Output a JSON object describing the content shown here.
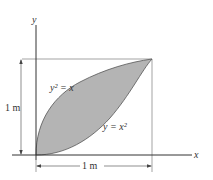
{
  "diagram": {
    "type": "area-between-curves",
    "axes": {
      "x_label": "x",
      "y_label": "y"
    },
    "curves": [
      {
        "label": "y² = x",
        "equation": "y^2 = x"
      },
      {
        "label": "y = x²",
        "equation": "y = x^2"
      }
    ],
    "dimensions": {
      "height": "1 m",
      "width": "1 m"
    },
    "colors": {
      "fill": "#b4b4b4",
      "line": "#555555",
      "text": "#333333"
    }
  }
}
